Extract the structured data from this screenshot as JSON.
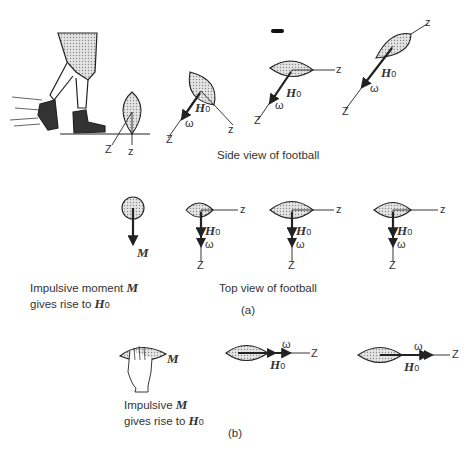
{
  "part_a": {
    "side_view": {
      "caption": "Side view of football",
      "axis_labels": {
        "space_axis": "Z",
        "body_axis": "z"
      },
      "vector_labels": {
        "angular_momentum": "H",
        "angular_momentum_sub": "0",
        "angular_velocity": "ω"
      }
    },
    "top_view": {
      "caption": "Top view of football",
      "axis_labels": {
        "space_axis": "Z",
        "body_axis": "z"
      },
      "moment_label": "M",
      "impulse_caption_line1_prefix": "Impulsive moment ",
      "impulse_caption_line1_symbol": "M",
      "impulse_caption_line2_prefix": "gives rise to ",
      "impulse_caption_line2_symbol": "H",
      "impulse_caption_line2_sub": "0"
    },
    "label": "(a)"
  },
  "part_b": {
    "moment_label": "M",
    "impulse_caption_line1_prefix": "Impulsive ",
    "impulse_caption_line1_symbol": "M",
    "impulse_caption_line2_prefix": "gives rise to ",
    "impulse_caption_line2_symbol": "H",
    "impulse_caption_line2_sub": "0",
    "axis_label": "Z",
    "vector_labels": {
      "angular_momentum": "H",
      "angular_momentum_sub": "0",
      "angular_velocity": "ω"
    },
    "label": "(b)"
  }
}
